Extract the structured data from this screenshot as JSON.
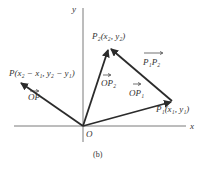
{
  "figure": {
    "caption": "(b)",
    "axes": {
      "x_label": "x",
      "y_label": "y",
      "origin_label": "O"
    },
    "points": {
      "P": {
        "label": "P(x₂ − x₁, y₂ − y₁)"
      },
      "P1": {
        "label": "P₁(x₁, y₁)"
      },
      "P2": {
        "label": "P₂(x₂, y₂)"
      }
    },
    "vectors": {
      "OP": "OP",
      "OP1": "OP₁",
      "OP2": "OP₂",
      "P1P2": "P₁P₂"
    },
    "colors": {
      "axis": "#7a7a7a",
      "vector": "#2b2b2b",
      "text": "#333333"
    }
  }
}
